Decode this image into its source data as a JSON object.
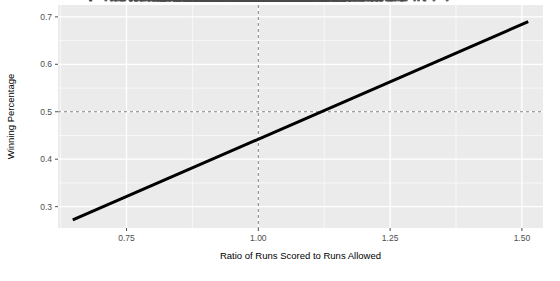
{
  "chart_data": {
    "type": "scatter",
    "title": "",
    "subtitle": "",
    "xlabel": "Ratio of Runs Scored to Runs Allowed",
    "ylabel": "Winning Percentage",
    "xlim": [
      0.62,
      1.54
    ],
    "ylim": [
      0.255,
      0.725
    ],
    "xticks": [
      0.75,
      1.0,
      1.25,
      1.5
    ],
    "xticklabels": [
      "0.75",
      "1.00",
      "1.25",
      "1.50"
    ],
    "yticks": [
      0.3,
      0.4,
      0.5,
      0.6,
      0.7
    ],
    "yticklabels": [
      "0.3",
      "0.4",
      "0.5",
      "0.6",
      "0.7"
    ],
    "grid": true,
    "grid_major_color": "#ffffff",
    "grid_minor_color": "#f7f7f7",
    "panel_background": "#ebebeb",
    "legend": "none",
    "point_color": "#4a4a4a",
    "point_size": 1.6,
    "point_opacity": 0.85,
    "n_points": 1100,
    "annotations": [
      {
        "name": "vertical-reference-line",
        "kind": "vline",
        "x": 1.0,
        "style": "dashed",
        "color": "#808080"
      },
      {
        "name": "horizontal-reference-line",
        "kind": "hline",
        "y": 0.5,
        "style": "dashed",
        "color": "#808080"
      }
    ],
    "fit": {
      "name": "linear-regression-line",
      "type": "line",
      "color": "#000000",
      "width": 3.0,
      "x": [
        0.648,
        1.512
      ],
      "y": [
        0.272,
        0.69
      ],
      "slope": 0.4838,
      "intercept": -0.0415
    },
    "series": [
      {
        "name": "Team Seasons",
        "color": "#4a4a4a",
        "description": "One point per team-season: run ratio vs winning percentage",
        "x_range": [
          0.64,
          1.51
        ],
        "y_range": [
          0.265,
          0.705
        ],
        "correlation": 0.94,
        "scatter_sd": 0.022
      }
    ]
  },
  "axes": {
    "y_title": "Winning Percentage",
    "x_title": "Ratio of Runs Scored to Runs Allowed"
  }
}
